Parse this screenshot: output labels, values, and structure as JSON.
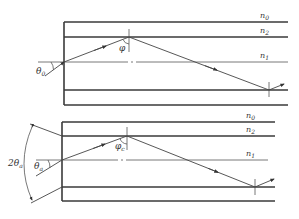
{
  "diagram": {
    "type": "optical-fiber-ray-diagram",
    "panels": [
      {
        "id": "top",
        "layers": [
          {
            "label": "n",
            "sub": "0",
            "name": "outer-layer"
          },
          {
            "label": "n",
            "sub": "2",
            "name": "cladding"
          },
          {
            "label": "n",
            "sub": "1",
            "name": "core"
          }
        ],
        "angles": [
          {
            "label": "θ",
            "sub": "0",
            "name": "incidence-angle"
          },
          {
            "label": "φ",
            "sub": "",
            "name": "internal-angle"
          }
        ]
      },
      {
        "id": "bottom",
        "layers": [
          {
            "label": "n",
            "sub": "0",
            "name": "outer-layer"
          },
          {
            "label": "n",
            "sub": "2",
            "name": "cladding"
          },
          {
            "label": "n",
            "sub": "1",
            "name": "core"
          }
        ],
        "angles": [
          {
            "label": "θ",
            "sub": "a",
            "name": "acceptance-angle"
          },
          {
            "label": "φ",
            "sub": "c",
            "name": "critical-angle"
          },
          {
            "label": "2θ",
            "sub": "a",
            "name": "full-acceptance-cone"
          }
        ]
      }
    ]
  }
}
